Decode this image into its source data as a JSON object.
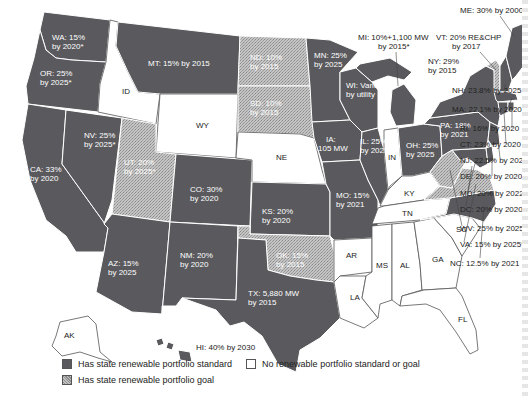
{
  "map": {
    "title": "State renewable portfolio standards and goals",
    "colors": {
      "standard": "#5a5a5e",
      "goal_fill": "#c8c8c8",
      "none": "#ffffff",
      "border": "#ffffff",
      "outline": "#555555"
    },
    "states": [
      {
        "abbr": "WA",
        "label": "WA: 15% by 2020*",
        "status": "standard"
      },
      {
        "abbr": "OR",
        "label": "OR: 25% by 2025*",
        "status": "standard"
      },
      {
        "abbr": "CA",
        "label": "CA: 33% by 2020",
        "status": "standard"
      },
      {
        "abbr": "NV",
        "label": "NV: 25% by 2025*",
        "status": "standard"
      },
      {
        "abbr": "ID",
        "label": "ID",
        "status": "none"
      },
      {
        "abbr": "MT",
        "label": "MT: 15% by 2015",
        "status": "standard"
      },
      {
        "abbr": "WY",
        "label": "WY",
        "status": "none"
      },
      {
        "abbr": "UT",
        "label": "UT: 20% by 2025*",
        "status": "goal"
      },
      {
        "abbr": "AZ",
        "label": "AZ: 15% by 2025",
        "status": "standard"
      },
      {
        "abbr": "CO",
        "label": "CO: 30% by 2020",
        "status": "standard"
      },
      {
        "abbr": "NM",
        "label": "NM: 20% by 2020",
        "status": "standard"
      },
      {
        "abbr": "ND",
        "label": "ND: 10% by 2015",
        "status": "goal"
      },
      {
        "abbr": "SD",
        "label": "SD: 10% by 2015",
        "status": "goal"
      },
      {
        "abbr": "NE",
        "label": "NE",
        "status": "none"
      },
      {
        "abbr": "KS",
        "label": "KS: 20% by 2020",
        "status": "standard"
      },
      {
        "abbr": "OK",
        "label": "OK: 15% by 2015",
        "status": "goal"
      },
      {
        "abbr": "TX",
        "label": "TX: 5,880 MW by 2015",
        "status": "standard"
      },
      {
        "abbr": "MN",
        "label": "MN: 25% by 2025",
        "status": "standard"
      },
      {
        "abbr": "IA",
        "label": "IA: 105 MW",
        "status": "standard"
      },
      {
        "abbr": "MO",
        "label": "MO: 15% by 2021",
        "status": "standard"
      },
      {
        "abbr": "AR",
        "label": "AR",
        "status": "none"
      },
      {
        "abbr": "LA",
        "label": "LA",
        "status": "none"
      },
      {
        "abbr": "WI",
        "label": "WI: Varies by utility",
        "status": "standard"
      },
      {
        "abbr": "IL",
        "label": "IL: 25% by 2025",
        "status": "standard"
      },
      {
        "abbr": "MI",
        "label": "MI: 10%+1,100 MW by 2015*",
        "status": "standard"
      },
      {
        "abbr": "IN",
        "label": "IN",
        "status": "none"
      },
      {
        "abbr": "OH",
        "label": "OH: 25% by 2025",
        "status": "standard"
      },
      {
        "abbr": "KY",
        "label": "KY",
        "status": "none"
      },
      {
        "abbr": "TN",
        "label": "TN",
        "status": "none"
      },
      {
        "abbr": "MS",
        "label": "MS",
        "status": "none"
      },
      {
        "abbr": "AL",
        "label": "AL",
        "status": "none"
      },
      {
        "abbr": "GA",
        "label": "GA",
        "status": "none"
      },
      {
        "abbr": "FL",
        "label": "FL",
        "status": "none"
      },
      {
        "abbr": "SC",
        "label": "SC",
        "status": "none"
      },
      {
        "abbr": "NC",
        "label": "NC: 12.5% by 2021",
        "status": "standard"
      },
      {
        "abbr": "VA",
        "label": "VA: 15% by 2025*",
        "status": "goal"
      },
      {
        "abbr": "WV",
        "label": "WV: 25% by 2025*",
        "status": "goal"
      },
      {
        "abbr": "PA",
        "label": "PA: 18% by 2021",
        "status": "standard"
      },
      {
        "abbr": "NY",
        "label": "NY: 29% by 2015",
        "status": "standard"
      },
      {
        "abbr": "VT",
        "label": "VT: 20% RE&CHP by 2017",
        "status": "goal"
      },
      {
        "abbr": "NH",
        "label": "NH: 23.8% by 2025",
        "status": "standard"
      },
      {
        "abbr": "ME",
        "label": "ME: 30% by 2000",
        "status": "standard"
      },
      {
        "abbr": "MA",
        "label": "MA: 22.1% by 2020",
        "status": "standard"
      },
      {
        "abbr": "RI",
        "label": "RI: 16% by 2020",
        "status": "standard"
      },
      {
        "abbr": "CT",
        "label": "CT: 23% by 2020",
        "status": "standard"
      },
      {
        "abbr": "NJ",
        "label": "NJ: 22.5% by 2021",
        "status": "standard"
      },
      {
        "abbr": "DE",
        "label": "DE: 20% by 2020*",
        "status": "standard"
      },
      {
        "abbr": "MD",
        "label": "MD: 20% by 2022",
        "status": "standard"
      },
      {
        "abbr": "DC",
        "label": "DC: 20% by 2020",
        "status": "standard"
      },
      {
        "abbr": "AK",
        "label": "AK",
        "status": "none"
      },
      {
        "abbr": "HI",
        "label": "HI: 40% by 2030",
        "status": "standard"
      }
    ],
    "text": {
      "wa1": "WA: 15%",
      "wa2": "by 2020*",
      "or1": "OR: 25%",
      "or2": "by 2025*",
      "ca1": "CA: 33%",
      "ca2": "by 2020",
      "nv1": "NV: 25%",
      "nv2": "by 2025*",
      "id": "ID",
      "mt": "MT: 15% by 2015",
      "wy": "WY",
      "ut1": "UT: 20%",
      "ut2": "by 2025*",
      "az1": "AZ: 15%",
      "az2": "by 2025",
      "co1": "CO: 30%",
      "co2": "by 2020",
      "nm1": "NM: 20%",
      "nm2": "by 2020",
      "nd1": "ND: 10%",
      "nd2": "by 2015",
      "sd1": "SD: 10%",
      "sd2": "by 2015",
      "ne": "NE",
      "ks1": "KS: 20%",
      "ks2": "by 2020",
      "ok1": "OK: 15%",
      "ok2": "by 2015",
      "tx1": "TX: 5,880 MW",
      "tx2": "by 2015",
      "mn1": "MN: 25%",
      "mn2": "by 2025",
      "ia1": "IA:",
      "ia2": "105 MW",
      "mo1": "MO: 15%",
      "mo2": "by 2021",
      "ar": "AR",
      "la": "LA",
      "wi1": "WI: Varies",
      "wi2": "by utility",
      "il1": "IL: 25%",
      "il2": "by 2025",
      "mi1": "MI: 10%+1,100 MW",
      "mi2": "by 2015*",
      "in": "IN",
      "oh1": "OH: 25%",
      "oh2": "by 2025",
      "ky": "KY",
      "tn": "TN",
      "ms": "MS",
      "al": "AL",
      "ga": "GA",
      "fl": "FL",
      "sc": "SC",
      "pa1": "PA: 18%",
      "pa2": "by 2021",
      "ny1": "NY: 29%",
      "ny2": "by 2015",
      "vt1": "VT: 20% RE&CHP",
      "vt2": "by 2017",
      "me": "ME: 30% by 2000",
      "nh": "NH: 23.8% by 2025",
      "ma": "MA: 22.1% by 2020",
      "ri": "RI: 16% by 2020",
      "ct": "CT: 23% by 2020",
      "nj": "NJ: 22.5% by 2021",
      "de": "DE: 20% by 2020*",
      "md": "MD: 20% by 2022",
      "dc": "DC: 20% by 2020",
      "wv": "WV: 25% by 2025*",
      "va": "VA: 15% by 2025*",
      "nc": "NC: 12.5% by 2021",
      "ak": "AK",
      "hi": "HI: 40% by 2030"
    }
  },
  "legend": {
    "standard": "Has state renewable portfolio standard",
    "none": "No renewable portfolio standard or goal",
    "goal": "Has state renewable portfolio goal"
  }
}
